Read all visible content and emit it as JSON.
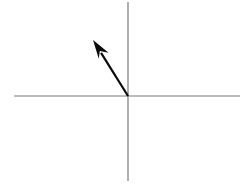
{
  "figure": {
    "width": 249,
    "height": 184,
    "background_color": "#ffffff"
  },
  "chart_data": {
    "type": "scatter",
    "title": "",
    "subtitle": "",
    "xlabel": "",
    "ylabel": "",
    "tick_labels_x": [],
    "tick_labels_y": [],
    "legend": [],
    "grid": false,
    "legend_position": "none",
    "origin_px": {
      "x": 128,
      "y": 96
    },
    "xlim_px": [
      14,
      240
    ],
    "ylim_px": [
      2,
      181
    ],
    "annotations": [
      {
        "name": "vector-arrow",
        "kind": "arrow",
        "from_px": {
          "x": 128,
          "y": 96
        },
        "to_px": {
          "x": 93,
          "y": 40
        },
        "dx_px": -35,
        "dy_px": -56,
        "length_px": 66,
        "angle_deg_from_positive_x_axis": 122,
        "quadrant": 2,
        "color": "#0b0b0b",
        "shaft_width_px": 2.2,
        "head_length_px": 19,
        "head_half_width_px": 6.5,
        "label": ""
      }
    ]
  },
  "axes": {
    "horizontal": {
      "name": "x-axis",
      "x1": 14,
      "y1": 96,
      "x2": 240,
      "y2": 96,
      "color": "#7b7b7f",
      "width_px": 1.2,
      "label": ""
    },
    "vertical": {
      "name": "y-axis",
      "x1": 128,
      "y1": 2,
      "x2": 128,
      "y2": 181,
      "color": "#7b7b7f",
      "width_px": 1.2,
      "label": ""
    }
  },
  "colors": {
    "axis": "#7b7b7f",
    "vector": "#0b0b0b",
    "background": "#ffffff"
  }
}
